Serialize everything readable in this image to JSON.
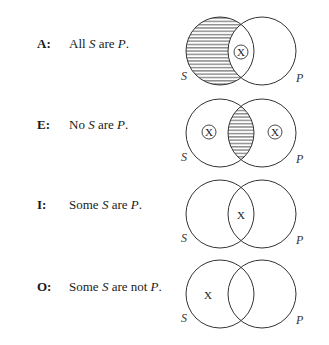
{
  "diagram": {
    "circle_labels": {
      "left": "S",
      "right": "P"
    },
    "mark": "X",
    "propositions": [
      {
        "letter": "A:",
        "statement_parts": [
          "All ",
          "S",
          " are ",
          "P",
          "."
        ],
        "shaded_regions": [
          "S-only"
        ],
        "x_marks": [
          {
            "region": "S-and-P",
            "circled": true
          }
        ]
      },
      {
        "letter": "E:",
        "statement_parts": [
          "No ",
          "S",
          " are ",
          "P",
          "."
        ],
        "shaded_regions": [
          "S-and-P"
        ],
        "x_marks": [
          {
            "region": "S-only",
            "circled": true
          },
          {
            "region": "P-only",
            "circled": true
          }
        ]
      },
      {
        "letter": "I:",
        "statement_parts": [
          "Some ",
          "S",
          " are ",
          "P",
          "."
        ],
        "shaded_regions": [],
        "x_marks": [
          {
            "region": "S-and-P",
            "circled": false
          }
        ]
      },
      {
        "letter": "O:",
        "statement_parts": [
          "Some ",
          "S",
          " are not ",
          "P",
          "."
        ],
        "shaded_regions": [],
        "x_marks": [
          {
            "region": "S-only",
            "circled": false
          }
        ]
      }
    ]
  },
  "colors": {
    "stroke": "#333333",
    "hatch": "#444444",
    "text": "#1a1a1a"
  }
}
